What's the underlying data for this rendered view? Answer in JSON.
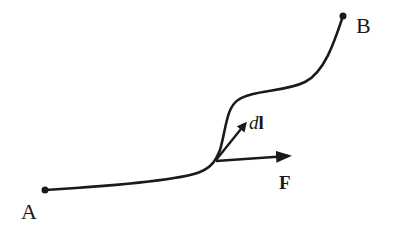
{
  "diagram": {
    "type": "line-integral-path",
    "stroke_color": "#1a1a1a",
    "background": "#ffffff",
    "points": [
      {
        "id": "A",
        "label": "A",
        "x": 45,
        "y": 190
      },
      {
        "id": "B",
        "label": "B",
        "x": 343,
        "y": 16
      }
    ],
    "path": {
      "from": "A",
      "to": "B",
      "description": "curved path from A to B"
    },
    "vectors": [
      {
        "id": "dl",
        "label_italic": "d",
        "label_bold": "l",
        "description": "infinitesimal displacement tangent to path"
      },
      {
        "id": "F",
        "label": "F",
        "description": "force vector"
      }
    ]
  }
}
